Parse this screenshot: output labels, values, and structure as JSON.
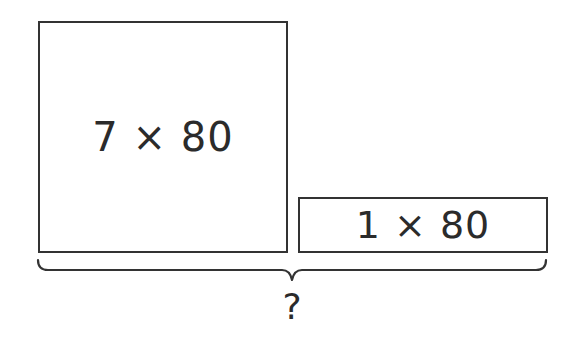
{
  "diagram": {
    "type": "bar-model",
    "left_box": {
      "label": "7 × 80"
    },
    "right_box": {
      "label": "1 × 80"
    },
    "brace": {
      "spans": "both boxes",
      "label": "?"
    },
    "colors": {
      "stroke": "#333333",
      "text": "#2b2b2b",
      "background": "#ffffff"
    }
  }
}
